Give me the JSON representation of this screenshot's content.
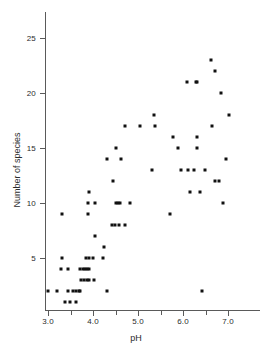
{
  "chart_data": {
    "type": "scatter",
    "title": "",
    "xlabel": "pH",
    "ylabel": "Number of species",
    "xlim": [
      2.85,
      7.6
    ],
    "ylim": [
      0.5,
      26.8
    ],
    "grid": false,
    "legend": "none",
    "marker": "square",
    "marker_color": "#111111",
    "axis_color": "#5a5a5a",
    "x_ticks": [
      3.0,
      3.5,
      4.0,
      4.5,
      5.0,
      5.5,
      6.0,
      6.5,
      7.0
    ],
    "x_tick_labels": [
      "3.0",
      "",
      "4.0",
      "",
      "5.0",
      "",
      "6.0",
      "",
      "7.0"
    ],
    "x_major_ticks": [
      3.0,
      4.0,
      5.0,
      6.0,
      7.0
    ],
    "y_ticks": [
      5,
      10,
      15,
      20,
      25
    ],
    "y_tick_labels": [
      "5",
      "10",
      "15",
      "20",
      "25"
    ],
    "n_points": 76,
    "points": [
      [
        3.0,
        2
      ],
      [
        3.2,
        2
      ],
      [
        3.3,
        9
      ],
      [
        3.3,
        5
      ],
      [
        3.28,
        4
      ],
      [
        3.37,
        1
      ],
      [
        3.45,
        2
      ],
      [
        3.45,
        4
      ],
      [
        3.48,
        1
      ],
      [
        3.55,
        2
      ],
      [
        3.62,
        2
      ],
      [
        3.62,
        1
      ],
      [
        3.68,
        2
      ],
      [
        3.7,
        2
      ],
      [
        3.72,
        4
      ],
      [
        3.78,
        4
      ],
      [
        3.82,
        4
      ],
      [
        3.86,
        4
      ],
      [
        3.9,
        4
      ],
      [
        3.74,
        3
      ],
      [
        3.8,
        3
      ],
      [
        3.86,
        3
      ],
      [
        3.92,
        3
      ],
      [
        3.85,
        5
      ],
      [
        3.9,
        5
      ],
      [
        3.88,
        9
      ],
      [
        3.88,
        10
      ],
      [
        3.9,
        11
      ],
      [
        4.0,
        5
      ],
      [
        4.02,
        3
      ],
      [
        4.05,
        7
      ],
      [
        4.05,
        10
      ],
      [
        4.22,
        5
      ],
      [
        4.25,
        6
      ],
      [
        4.3,
        14
      ],
      [
        4.32,
        2
      ],
      [
        4.42,
        8
      ],
      [
        4.45,
        12
      ],
      [
        4.48,
        8
      ],
      [
        4.5,
        10
      ],
      [
        4.52,
        15
      ],
      [
        4.55,
        10
      ],
      [
        4.58,
        8
      ],
      [
        4.6,
        10
      ],
      [
        4.62,
        14
      ],
      [
        4.7,
        8
      ],
      [
        4.72,
        17
      ],
      [
        4.82,
        10
      ],
      [
        5.05,
        17
      ],
      [
        5.32,
        13
      ],
      [
        5.35,
        18
      ],
      [
        5.38,
        17
      ],
      [
        5.7,
        9
      ],
      [
        5.78,
        16
      ],
      [
        5.88,
        15
      ],
      [
        6.08,
        21
      ],
      [
        6.1,
        13
      ],
      [
        6.15,
        11
      ],
      [
        6.25,
        13
      ],
      [
        6.28,
        21
      ],
      [
        6.32,
        21
      ],
      [
        6.3,
        16
      ],
      [
        6.32,
        15
      ],
      [
        6.38,
        11
      ],
      [
        6.42,
        2
      ],
      [
        6.48,
        13
      ],
      [
        6.62,
        23
      ],
      [
        6.65,
        17
      ],
      [
        6.7,
        22
      ],
      [
        6.72,
        12
      ],
      [
        6.8,
        12
      ],
      [
        6.85,
        20
      ],
      [
        6.88,
        10
      ],
      [
        6.95,
        14
      ],
      [
        7.02,
        18
      ],
      [
        5.95,
        13
      ]
    ]
  },
  "axes": {
    "x_axis_name": "pH",
    "y_axis_name": "Number of species"
  }
}
